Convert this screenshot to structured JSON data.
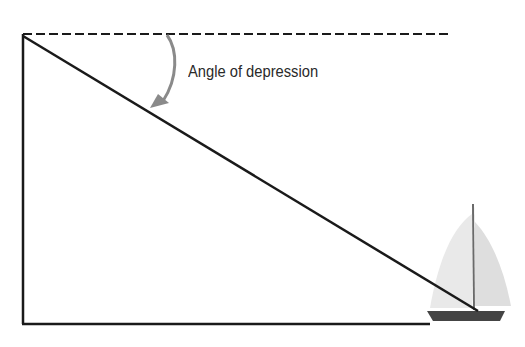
{
  "diagram": {
    "label": "Angle of depression",
    "colors": {
      "line": "#1a1a1a",
      "arrow": "#8a8a8a",
      "hull": "#444444",
      "sail_left": "#e9e9e9",
      "sail_right": "#dedede",
      "mast": "#6a6a6a"
    },
    "elements": {
      "horizontal_reference": "dashed line",
      "line_of_sight": "diagonal line from observer to boat",
      "vertical_side": "vertical line",
      "ground": "horizontal base line",
      "object": "sailboat"
    }
  }
}
